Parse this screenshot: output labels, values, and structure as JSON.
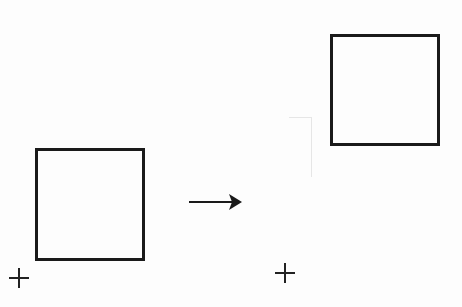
{
  "diagram": {
    "colors": {
      "stroke": "#1a1a1a",
      "background": "#fdfdfd"
    },
    "before": {
      "square": {
        "x": 35,
        "y": 148,
        "width": 110,
        "height": 113
      },
      "origin_marker": {
        "symbol": "+",
        "cx": 19,
        "cy": 278
      }
    },
    "arrow": {
      "x1": 189,
      "y1": 202,
      "x2": 241,
      "y2": 202,
      "direction": "right"
    },
    "after": {
      "square": {
        "x": 330,
        "y": 34,
        "width": 110,
        "height": 112
      },
      "origin_marker": {
        "symbol": "+",
        "cx": 285,
        "cy": 273
      }
    }
  }
}
